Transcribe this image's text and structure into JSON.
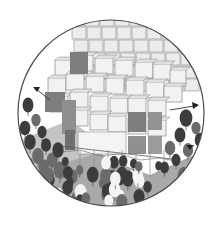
{
  "illustration": {
    "subject": "Architectural axonometric vignette: modular cube building surrounded by a forest",
    "style": "grayscale line drawing in circular frame",
    "colors": {
      "background": "#ffffff",
      "frame_stroke": "#4a4a4a",
      "line": "#8a8a8a",
      "dark_panel": "#7d7d7d",
      "mid_panel": "#b8b8b8",
      "light_panel": "#ececec",
      "ground": "#a9a9a9",
      "tree_dark": "#3c3c3c",
      "tree_mid": "#6b6b6b",
      "tree_light": "#f4f4f4"
    },
    "arrows": [
      {
        "name": "left-arrow",
        "direction": "up-left"
      },
      {
        "name": "right-arrow",
        "direction": "right"
      },
      {
        "name": "right-lower-arrow",
        "direction": "down"
      }
    ]
  }
}
